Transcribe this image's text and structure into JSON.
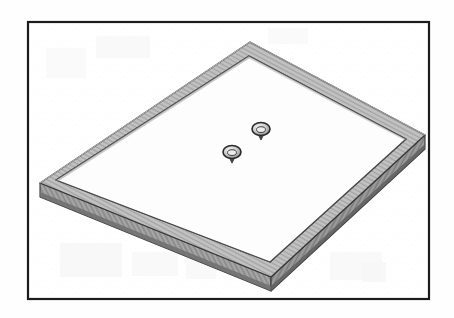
{
  "figure": {
    "domain": "Diagram",
    "title": "Isometric line drawing of a rectangular shallow tray with raised rim",
    "caption": "",
    "media": "scanned black-and-white technical illustration",
    "background_color": "#fefefe",
    "canvas": {
      "width": 454,
      "height": 318
    }
  },
  "border": {
    "name": "figure-border",
    "shape": "rectangle",
    "stroke_color": "#1c1c1c",
    "stroke_width": 2,
    "fill": "none",
    "x": 27,
    "y": 21,
    "width": 403,
    "height": 279
  },
  "object": {
    "name": "rectangular-tray",
    "description": "Shallow rectangular tray / panel shown in isometric perspective with a raised perimeter rim and visible slab thickness on the two near edges.",
    "projection": "isometric",
    "top_face": {
      "name": "tray-rim-top",
      "fill_color": "#b9b9b9",
      "stroke_color": "#3a3a3a",
      "stroke_width": 1.2,
      "corners": {
        "top": [
          250,
          42
        ],
        "right": [
          425,
          135
        ],
        "bottom": [
          271,
          277
        ],
        "left": [
          40,
          183
        ]
      }
    },
    "inner_cavity": {
      "name": "tray-inner-surface",
      "fill_color": "#fdfdfd",
      "stroke_color": "#454545",
      "stroke_width": 1.1,
      "corners": {
        "top": [
          249,
          56
        ],
        "right": [
          406,
          139
        ],
        "bottom": [
          270,
          262
        ],
        "left": [
          56,
          180
        ]
      }
    },
    "left_side_face": {
      "name": "tray-side-face-left",
      "fill_color": "#9a9a9a",
      "stroke_color": "#333333",
      "thickness_px": 16
    },
    "right_side_face": {
      "name": "tray-side-face-right",
      "fill_color": "#8a8a8a",
      "stroke_color": "#333333",
      "thickness_px": 16
    },
    "bottom_edge_band": {
      "name": "tray-bottom-edge-band",
      "fill_color": "#6f6f6f",
      "stroke_color": "#2b2b2b"
    }
  },
  "features": [
    {
      "name": "grommet-upper",
      "type": "circular-knob",
      "label": "",
      "center_x": 261,
      "center_y": 129,
      "radius_x": 9,
      "radius_y": 6.5,
      "fill_color": "#d4d4d4",
      "stroke_color": "#2a2a2a",
      "has_stem": true,
      "stem_length": 6
    },
    {
      "name": "grommet-lower",
      "type": "circular-knob",
      "label": "",
      "center_x": 232,
      "center_y": 152,
      "radius_x": 9,
      "radius_y": 6.5,
      "fill_color": "#d4d4d4",
      "stroke_color": "#2a2a2a",
      "has_stem": true,
      "stem_length": 6
    }
  ],
  "palette": {
    "border_ink": "#1c1c1c",
    "rim_gray": "#b9b9b9",
    "side_gray": "#9a9a9a",
    "deep_gray": "#6f6f6f",
    "cavity_white": "#fdfdfd",
    "page_white": "#fefefe",
    "noise_gray": "#dcdcdc"
  },
  "annotations": {
    "reference_numerals": [],
    "leader_lines": [],
    "dimension_lines": []
  }
}
